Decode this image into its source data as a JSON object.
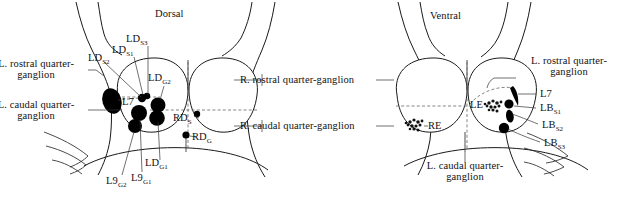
{
  "figure": {
    "title_left": "Dorsal",
    "title_right": "Ventral",
    "background_color": "#ffffff",
    "ink_color": "#1a1a1a",
    "blob_color": "#000000"
  },
  "dorsal": {
    "view_label": "Dorsal",
    "labels": {
      "l_rostral_quarter_ganglion": "L. rostral quarter-ganglion",
      "l_caudal_quarter_ganglion": "L. caudal quarter-ganglion",
      "r_rostral_quarter_ganglion": "R. rostral quarter-ganglion",
      "r_caudal_quarter_ganglion": "R. caudal quarter-ganglion",
      "l7": "L7"
    },
    "markers": [
      {
        "id": "LD_S3",
        "base": "LD",
        "subscript": "S3",
        "label": "LD"
      },
      {
        "id": "LD_S1",
        "base": "LD",
        "subscript": "S1",
        "label": "LD"
      },
      {
        "id": "LD_S2",
        "base": "LD",
        "subscript": "S2",
        "label": "LD"
      },
      {
        "id": "LD_G2",
        "base": "LD",
        "subscript": "G2",
        "label": "LD"
      },
      {
        "id": "LD_G1",
        "base": "LD",
        "subscript": "G1",
        "label": "LD"
      },
      {
        "id": "L9_G1",
        "base": "L9",
        "subscript": "G1",
        "label": "L9"
      },
      {
        "id": "L9_G2",
        "base": "L9",
        "subscript": "G2",
        "label": "L9"
      },
      {
        "id": "RD_S",
        "base": "RD",
        "subscript": "S",
        "label": "RD"
      },
      {
        "id": "RD_G",
        "base": "RD",
        "subscript": "G",
        "label": "RD"
      }
    ]
  },
  "ventral": {
    "view_label": "Ventral",
    "labels": {
      "l_rostral_quarter_ganglion": "L. rostral quarter-ganglion",
      "l_caudal_quarter_ganglion": "L. caudal quarter-ganglion",
      "l7": "L7",
      "le": "LE",
      "re": "RE"
    },
    "markers": [
      {
        "id": "LB_S1",
        "base": "LB",
        "subscript": "S1",
        "label": "LB"
      },
      {
        "id": "LB_S2",
        "base": "LB",
        "subscript": "S2",
        "label": "LB"
      },
      {
        "id": "LB_S3",
        "base": "LB",
        "subscript": "S3",
        "label": "LB"
      }
    ]
  }
}
